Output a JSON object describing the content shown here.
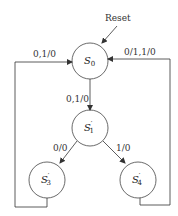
{
  "diagram": {
    "type": "state-machine",
    "reset_label": "Reset",
    "states": [
      {
        "id": "S0",
        "name": "S",
        "sub": "0",
        "prime": ""
      },
      {
        "id": "S1",
        "name": "S",
        "sub": "1",
        "prime": "′"
      },
      {
        "id": "S3",
        "name": "S",
        "sub": "3",
        "prime": "′"
      },
      {
        "id": "S4",
        "name": "S",
        "sub": "4",
        "prime": "′"
      }
    ],
    "transitions": [
      {
        "from": "S3",
        "to": "S0",
        "label": "0,1/0"
      },
      {
        "from": "S4",
        "to": "S0",
        "label": "0/1,1/0"
      },
      {
        "from": "S0",
        "to": "S1",
        "label": "0,1/0"
      },
      {
        "from": "S1",
        "to": "S3",
        "label": "0/0"
      },
      {
        "from": "S1",
        "to": "S4",
        "label": "1/0"
      }
    ],
    "colors": {
      "line": "#333333",
      "background": "#ffffff"
    }
  }
}
